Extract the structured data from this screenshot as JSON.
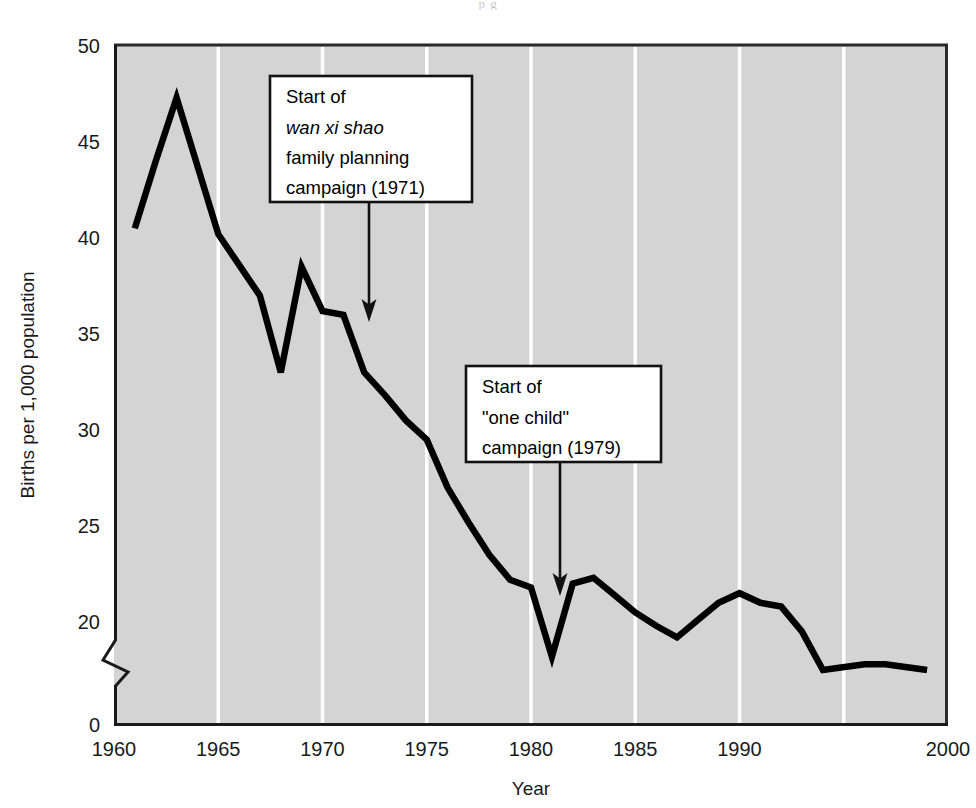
{
  "figure": {
    "bleed_text": "p g",
    "plot_bg_color": "#d4d4d4",
    "line_color": "#000000",
    "gridline_color": "#ffffff",
    "frame_color": "#2a2a2a"
  },
  "axes": {
    "x": {
      "title": "Year",
      "tick_labels": [
        "1960",
        "1965",
        "1970",
        "1975",
        "1980",
        "1985",
        "1990",
        "2000"
      ],
      "tick_values": [
        1960,
        1965,
        1970,
        1975,
        1980,
        1985,
        1990,
        2000
      ],
      "gridline_values": [
        1965,
        1970,
        1975,
        1980,
        1985,
        1990,
        1995
      ],
      "range": [
        1960,
        2000
      ]
    },
    "y": {
      "title": "Births per 1,000 population",
      "tick_labels": [
        "0",
        "20",
        "25",
        "30",
        "35",
        "40",
        "45",
        "50"
      ],
      "tick_values": [
        0,
        20,
        25,
        30,
        35,
        40,
        45,
        50
      ],
      "range": [
        20,
        50
      ],
      "axis_break": true,
      "axis_break_note": "zigzag break between 0 and 20"
    }
  },
  "annotations": [
    {
      "id": "wan-xi-shao",
      "lines": [
        "Start of",
        "wan xi shao",
        "family planning",
        "campaign (1971)"
      ],
      "italic_line_index": 1,
      "points_to_year": 1971,
      "points_to_value": 36.0
    },
    {
      "id": "one-child",
      "lines": [
        "Start of",
        "\"one child\"",
        "campaign (1979)"
      ],
      "italic_line_index": -1,
      "points_to_year": 1979,
      "points_to_value": 21.8
    }
  ],
  "chart_data": {
    "type": "line",
    "title": "",
    "subtitle": "",
    "xlabel": "Year",
    "ylabel": "Births per 1,000 population",
    "xlim": [
      1960,
      2000
    ],
    "ylim": [
      20,
      50
    ],
    "grid": "vertical-only",
    "legend": "none",
    "series": [
      {
        "name": "Crude birth rate, China",
        "x": [
          1961,
          1962,
          1963,
          1965,
          1966,
          1967,
          1968,
          1969,
          1970,
          1971,
          1972,
          1973,
          1974,
          1975,
          1976,
          1977,
          1978,
          1979,
          1980,
          1981,
          1982,
          1983,
          1984,
          1985,
          1986,
          1987,
          1988,
          1989,
          1990,
          1991,
          1992,
          1993,
          1994,
          1996,
          1997,
          1999
        ],
        "values": [
          40.5,
          44.0,
          47.3,
          40.2,
          38.6,
          37.0,
          33.0,
          38.5,
          36.2,
          36.0,
          33.0,
          31.8,
          30.5,
          29.5,
          27.0,
          25.2,
          23.5,
          22.2,
          21.8,
          18.2,
          22.0,
          22.3,
          21.4,
          20.5,
          19.8,
          19.2,
          20.1,
          21.0,
          21.5,
          21.0,
          20.8,
          19.5,
          17.5,
          17.8,
          17.8,
          17.5
        ]
      }
    ],
    "annotations": [
      {
        "label": "Start of wan xi shao family planning campaign (1971)",
        "x": 1971,
        "y": 36.0
      },
      {
        "label": "Start of \"one child\" campaign (1979)",
        "x": 1979,
        "y": 21.8
      }
    ]
  }
}
